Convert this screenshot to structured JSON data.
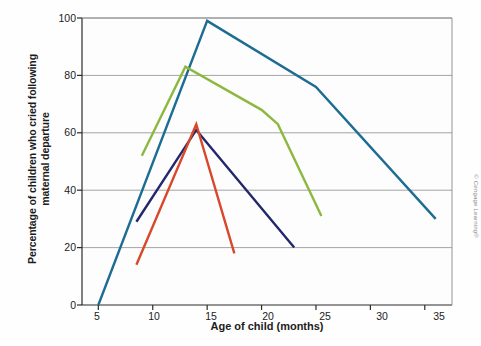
{
  "figure": {
    "credit": "© Cengage Learning®",
    "background": "#fefefe"
  },
  "chart_data": {
    "type": "line",
    "title": "",
    "xlabel": "Age of child (months)",
    "ylabel": "Percentage of children who cried\nfollowing maternal departure",
    "xlim": [
      3.5,
      37.5
    ],
    "ylim": [
      0,
      100
    ],
    "xticks": [
      5,
      10,
      15,
      20,
      25,
      30,
      35
    ],
    "yticks": [
      0,
      20,
      40,
      60,
      80,
      100
    ],
    "grid": "horizontal",
    "legend": "inline-annotations",
    "series": [
      {
        "name": "African Bushmen",
        "color": "#1d6d93",
        "label_x": 345,
        "label_y": 96,
        "points": [
          [
            5,
            0
          ],
          [
            15,
            99
          ],
          [
            25,
            76
          ],
          [
            36,
            30
          ]
        ]
      },
      {
        "name": "Antigua, Guatemala",
        "color": "#8cb83f",
        "label_x": 315,
        "label_y": 171,
        "points": [
          [
            9,
            52
          ],
          [
            13,
            83
          ],
          [
            20,
            68
          ],
          [
            21.5,
            63
          ],
          [
            25.5,
            31
          ]
        ]
      },
      {
        "name": "Israeli kibbutz",
        "color": "#23276b",
        "label_x": 296,
        "label_y": 226,
        "points": [
          [
            8.5,
            29
          ],
          [
            14,
            61
          ],
          [
            23,
            20
          ]
        ]
      },
      {
        "name": "Guatemalan Indian",
        "color": "#d9482b",
        "label_x": 201,
        "label_y": 243,
        "points": [
          [
            8.5,
            14
          ],
          [
            14,
            63
          ],
          [
            17.5,
            18
          ]
        ]
      }
    ]
  },
  "axis_text": {
    "xticks": [
      "5",
      "10",
      "15",
      "20",
      "25",
      "30",
      "35"
    ],
    "yticks": [
      "100",
      "80",
      "60",
      "40",
      "20",
      "0"
    ]
  },
  "annotations": [
    {
      "name": "african-bushmen",
      "text": "African Bushmen"
    },
    {
      "name": "antigua-guatemala",
      "text": "Antigua,\nGuatemala"
    },
    {
      "name": "israeli-kibbutz",
      "text": "Israeli\nkibbutz"
    },
    {
      "name": "guatemalan-indian",
      "text": "Guatemalan\nIndian"
    }
  ]
}
